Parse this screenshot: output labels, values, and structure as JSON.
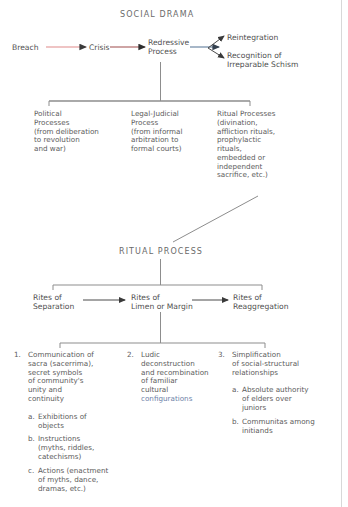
{
  "diagram": {
    "title": "SOCIAL DRAMA",
    "mid_title": "RITUAL PROCESS",
    "colors": {
      "arrow_breach_crisis": "#e08a8a",
      "arrow_crisis_redressive": "#9e4a4a",
      "arrow_redressive_outcomes": "#5f7d9c",
      "line": "#8d8d8d",
      "text": "#5b5b5b",
      "accent_blue": "#6d7fa8"
    },
    "phases": {
      "breach": "Breach",
      "crisis": "Crisis",
      "redressive": "Redressive\nProcess",
      "reintegration": "Reintegration",
      "schism": "Recognition of\nIrreparable Schism"
    },
    "redressive_types": [
      {
        "name": "political",
        "text": "Political\nProcesses\n(from deliberation\nto revolution\nand war)"
      },
      {
        "name": "legal-judicial",
        "text": "Legal-Judicial\nProcess\n(from informal\narbitration to\nformal courts)"
      },
      {
        "name": "ritual",
        "text": "Ritual Processes\n(divination,\naffliction rituals,\nprophylactic\nrituals,\nembedded or\nindependent\nsacrifice, etc.)"
      }
    ],
    "rites": {
      "separation": "Rites of\nSeparation",
      "limen": "Rites of\nLimen or Margin",
      "reaggregation": "Rites of\nReaggregation"
    },
    "liminal_features": [
      {
        "number": "1.",
        "body": "Communication of\nsacra (sacerrima),\nsecret symbols\nof community's\nunity and\ncontinuity",
        "sub": [
          {
            "marker": "a.",
            "text": "Exhibitions of\nobjects"
          },
          {
            "marker": "b.",
            "text": "Instructions\n(myths, riddles,\ncatechisms)"
          },
          {
            "marker": "c.",
            "text": "Actions (enactment\nof myths, dance,\ndramas, etc.)"
          }
        ]
      },
      {
        "number": "2.",
        "body": "Ludic\ndeconstruction\nand recombination\nof familiar\ncultural",
        "body_accent": "configurations",
        "sub": []
      },
      {
        "number": "3.",
        "body": "Simplification\nof social-structural\nrelationships",
        "sub": [
          {
            "marker": "a.",
            "text": "Absolute authority\nof elders over\njuniors"
          },
          {
            "marker": "b.",
            "text": "Communitas among\ninitiands"
          }
        ]
      }
    ]
  }
}
